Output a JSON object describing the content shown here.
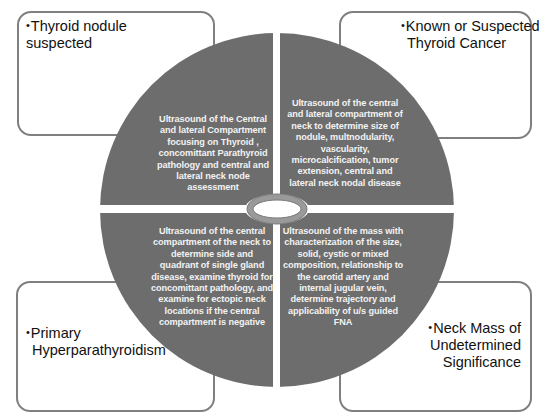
{
  "colors": {
    "quadrant_fill": "#6d6d6d",
    "box_border": "#7f7f7f",
    "ring_fill": "#a6a6a6",
    "ring_stroke": "#7f7f7f",
    "background": "#ffffff"
  },
  "boxes": {
    "top_left": {
      "bullet": "•",
      "label_line1": "Thyroid nodule",
      "label_line2": "suspected"
    },
    "top_right": {
      "bullet": "•",
      "label_line1": "Known or Suspected",
      "label_line2": "Thyroid Cancer"
    },
    "bottom_left": {
      "bullet": "•",
      "label_line1": "Primary",
      "label_line2": "Hyperparathyroidism"
    },
    "bottom_right": {
      "bullet": "•",
      "label_line1": "Neck Mass of",
      "label_line2": "Undetermined",
      "label_line3": "Significance"
    }
  },
  "quadrants": {
    "top_left": {
      "lines": [
        "Ultrasound of the Central",
        "and lateral Compartment",
        "focusing on Thyroid ,",
        "concomittant Parathyroid",
        "pathology and central and",
        "lateral neck node",
        "assessment"
      ]
    },
    "top_right": {
      "lines": [
        "Ultrasound of the central",
        "and lateral compartment of",
        "neck to determine size of",
        "nodule, multnodularity,",
        "vascularity,",
        "microcalcification, tumor",
        "extension, central and",
        "lateral neck nodal disease"
      ]
    },
    "bottom_left": {
      "lines": [
        "Ultrasound  of the central",
        "compartment of the neck to",
        "determine side and",
        "quadrant of single gland",
        "disease, examine thyroid for",
        "concomittant pathology, and",
        "examine for ectopic neck",
        "locations if the central",
        "compartment is negative"
      ]
    },
    "bottom_right": {
      "lines": [
        "Ultrasound of the mass with",
        "characterization of the size,",
        "solid, cystic or mixed",
        "composition, relationship to",
        "the carotid artery and",
        "internal jugular vein,",
        "determine trajectory and",
        "applicability of u/s guided",
        "FNA"
      ]
    }
  },
  "center": {
    "icon": "ring-icon"
  }
}
